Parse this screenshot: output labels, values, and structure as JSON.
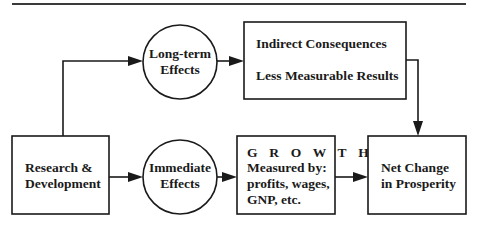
{
  "diagram": {
    "nodes": {
      "research": {
        "shape": "box",
        "lines": [
          "Research &",
          "Development"
        ]
      },
      "long_term": {
        "shape": "circle",
        "lines": [
          "Long-term",
          "Effects"
        ]
      },
      "immediate": {
        "shape": "circle",
        "lines": [
          "Immediate",
          "Effects"
        ]
      },
      "indirect": {
        "shape": "box",
        "lines": [
          "Indirect Consequences",
          "Less Measurable Results"
        ]
      },
      "growth": {
        "shape": "box",
        "lines": [
          "G R O W T H",
          "Measured by:",
          "profits, wages,",
          "GNP, etc."
        ]
      },
      "net_change": {
        "shape": "box",
        "lines": [
          "Net Change",
          "in Prosperity"
        ]
      }
    },
    "edges": [
      {
        "from": "research",
        "to": "long_term"
      },
      {
        "from": "research",
        "to": "immediate"
      },
      {
        "from": "long_term",
        "to": "indirect"
      },
      {
        "from": "immediate",
        "to": "growth"
      },
      {
        "from": "growth",
        "to": "net_change"
      },
      {
        "from": "indirect",
        "to": "net_change"
      }
    ]
  }
}
